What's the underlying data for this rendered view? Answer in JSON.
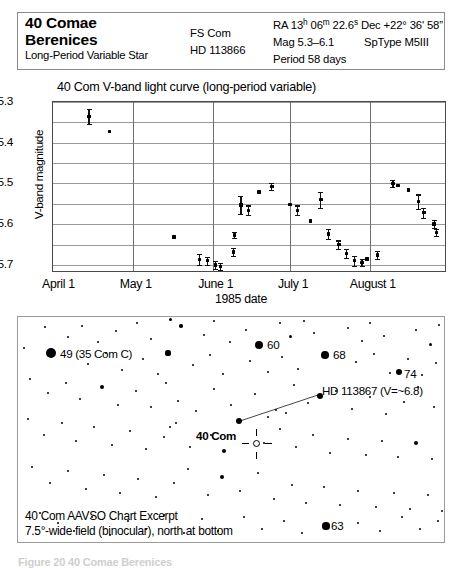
{
  "header": {
    "star_name_line1": "40 Comae",
    "star_name_line2": "Berenices",
    "subtitle": "Long-Period Variable Star",
    "designation_1": "FS Com",
    "designation_2": "HD 113866",
    "ra_label": "RA",
    "ra_hours": "13",
    "ra_h_unit": "h",
    "ra_minutes": "06",
    "ra_m_unit": "m",
    "ra_seconds": "22.6",
    "ra_s_unit": "s",
    "dec": "Dec +22° 36' 58”",
    "mag": "Mag   5.3–6.1",
    "sptype": "SpType M5III",
    "period": "Period 58 days"
  },
  "chart_data": {
    "type": "scatter",
    "title": "40 Com  V-band light curve (long-period variable)",
    "xlabel": "1985 date",
    "ylabel": "V-band magnitude",
    "ylim": [
      5.3,
      5.72
    ],
    "y_inverted": true,
    "yticks": [
      5.3,
      5.4,
      5.5,
      5.6,
      5.7
    ],
    "ygrid_minor": [
      5.35,
      5.45,
      5.55,
      5.65
    ],
    "xlim_days": [
      0,
      153
    ],
    "xtick_labels": [
      "April 1",
      "May 1",
      "June 1",
      "July 1",
      "August 1"
    ],
    "xtick_days": [
      1,
      31,
      62,
      92,
      123
    ],
    "grid": true,
    "legend": "none",
    "points": [
      {
        "day": 14,
        "mag": 5.335,
        "err": 0.018
      },
      {
        "day": 22,
        "mag": 5.372,
        "err": 0.0
      },
      {
        "day": 47,
        "mag": 5.632,
        "err": 0.0
      },
      {
        "day": 57,
        "mag": 5.687,
        "err": 0.014
      },
      {
        "day": 60,
        "mag": 5.69,
        "err": 0.01
      },
      {
        "day": 63,
        "mag": 5.7,
        "err": 0.01
      },
      {
        "day": 65,
        "mag": 5.704,
        "err": 0.008
      },
      {
        "day": 70,
        "mag": 5.668,
        "err": 0.01
      },
      {
        "day": 70.5,
        "mag": 5.627,
        "err": 0.008
      },
      {
        "day": 73,
        "mag": 5.553,
        "err": 0.022
      },
      {
        "day": 76,
        "mag": 5.566,
        "err": 0.012
      },
      {
        "day": 80,
        "mag": 5.521,
        "err": 0.0
      },
      {
        "day": 85,
        "mag": 5.507,
        "err": 0.008
      },
      {
        "day": 92,
        "mag": 5.552,
        "err": 0.0
      },
      {
        "day": 95,
        "mag": 5.566,
        "err": 0.012
      },
      {
        "day": 100,
        "mag": 5.592,
        "err": 0.0
      },
      {
        "day": 104,
        "mag": 5.54,
        "err": 0.02
      },
      {
        "day": 107,
        "mag": 5.624,
        "err": 0.012
      },
      {
        "day": 111,
        "mag": 5.65,
        "err": 0.01
      },
      {
        "day": 114,
        "mag": 5.672,
        "err": 0.012
      },
      {
        "day": 117,
        "mag": 5.69,
        "err": 0.012
      },
      {
        "day": 120,
        "mag": 5.694,
        "err": 0.008
      },
      {
        "day": 122,
        "mag": 5.686,
        "err": 0.0
      },
      {
        "day": 126,
        "mag": 5.676,
        "err": 0.01
      },
      {
        "day": 132,
        "mag": 5.5,
        "err": 0.008
      },
      {
        "day": 134,
        "mag": 5.505,
        "err": 0.0
      },
      {
        "day": 138,
        "mag": 5.516,
        "err": 0.0
      },
      {
        "day": 142,
        "mag": 5.545,
        "err": 0.018
      },
      {
        "day": 144,
        "mag": 5.572,
        "err": 0.012
      },
      {
        "day": 148,
        "mag": 5.6,
        "err": 0.01
      },
      {
        "day": 149,
        "mag": 5.62,
        "err": 0.008
      }
    ]
  },
  "starchart": {
    "caption_line1": "40 Com AAVSO Chart Excerpt",
    "caption_line2": "7.5°-wide field (binocular), north at bottom",
    "labels": [
      {
        "text": "49 (35 Com C)",
        "x": 42,
        "y": 30,
        "bold": false
      },
      {
        "text": "60",
        "x": 249,
        "y": 21,
        "bold": false
      },
      {
        "text": "68",
        "x": 315,
        "y": 31,
        "bold": false
      },
      {
        "text": "74",
        "x": 386,
        "y": 50,
        "bold": false
      },
      {
        "text": "HD 113867 (V=~6.8)",
        "x": 304,
        "y": 67,
        "bold": false
      },
      {
        "text": "40 Com",
        "x": 178,
        "y": 112,
        "bold": true
      },
      {
        "text": "63",
        "x": 313,
        "y": 202,
        "bold": false
      }
    ],
    "named_stars": [
      {
        "x": 33,
        "y": 36,
        "r": 5.2
      },
      {
        "x": 241,
        "y": 28,
        "r": 4.2
      },
      {
        "x": 307,
        "y": 38,
        "r": 3.8
      },
      {
        "x": 381,
        "y": 55,
        "r": 3.2
      },
      {
        "x": 302,
        "y": 79,
        "r": 3.4
      },
      {
        "x": 221,
        "y": 104,
        "r": 3.4
      },
      {
        "x": 308,
        "y": 209,
        "r": 3.6
      }
    ],
    "field_stars": [
      {
        "x": 27,
        "y": 10,
        "r": 1.0
      },
      {
        "x": 50,
        "y": 20,
        "r": 1.3
      },
      {
        "x": 64,
        "y": 9,
        "r": 1.4
      },
      {
        "x": 80,
        "y": 25,
        "r": 1.0
      },
      {
        "x": 98,
        "y": 14,
        "r": 1.1
      },
      {
        "x": 119,
        "y": 6,
        "r": 1.2
      },
      {
        "x": 133,
        "y": 22,
        "r": 1.0
      },
      {
        "x": 152,
        "y": 2,
        "r": 1.5
      },
      {
        "x": 163,
        "y": 9,
        "r": 1.8
      },
      {
        "x": 186,
        "y": 18,
        "r": 1.2
      },
      {
        "x": 196,
        "y": 4,
        "r": 1.1
      },
      {
        "x": 212,
        "y": 25,
        "r": 1.4
      },
      {
        "x": 228,
        "y": 13,
        "r": 1.0
      },
      {
        "x": 262,
        "y": 6,
        "r": 1.0
      },
      {
        "x": 272,
        "y": 19,
        "r": 1.5
      },
      {
        "x": 286,
        "y": 4,
        "r": 1.2
      },
      {
        "x": 296,
        "y": 16,
        "r": 1.0
      },
      {
        "x": 330,
        "y": 11,
        "r": 1.1
      },
      {
        "x": 344,
        "y": 24,
        "r": 1.2
      },
      {
        "x": 352,
        "y": 6,
        "r": 1.0
      },
      {
        "x": 366,
        "y": 19,
        "r": 1.3
      },
      {
        "x": 398,
        "y": 13,
        "r": 1.1
      },
      {
        "x": 412,
        "y": 27,
        "r": 1.5
      },
      {
        "x": 421,
        "y": 8,
        "r": 1.0
      },
      {
        "x": 6,
        "y": 31,
        "r": 1.2
      },
      {
        "x": 70,
        "y": 47,
        "r": 1.4
      },
      {
        "x": 88,
        "y": 36,
        "r": 1.1
      },
      {
        "x": 104,
        "y": 53,
        "r": 1.0
      },
      {
        "x": 125,
        "y": 42,
        "r": 1.3
      },
      {
        "x": 140,
        "y": 57,
        "r": 1.2
      },
      {
        "x": 150,
        "y": 36,
        "r": 2.6
      },
      {
        "x": 175,
        "y": 48,
        "r": 1.1
      },
      {
        "x": 192,
        "y": 38,
        "r": 1.4
      },
      {
        "x": 205,
        "y": 57,
        "r": 1.0
      },
      {
        "x": 232,
        "y": 44,
        "r": 1.2
      },
      {
        "x": 250,
        "y": 55,
        "r": 1.3
      },
      {
        "x": 264,
        "y": 40,
        "r": 1.0
      },
      {
        "x": 280,
        "y": 52,
        "r": 1.1
      },
      {
        "x": 338,
        "y": 45,
        "r": 1.2
      },
      {
        "x": 356,
        "y": 37,
        "r": 1.0
      },
      {
        "x": 372,
        "y": 56,
        "r": 1.3
      },
      {
        "x": 390,
        "y": 42,
        "r": 1.1
      },
      {
        "x": 404,
        "y": 58,
        "r": 1.2
      },
      {
        "x": 418,
        "y": 46,
        "r": 1.0
      },
      {
        "x": 12,
        "y": 62,
        "r": 1.1
      },
      {
        "x": 30,
        "y": 76,
        "r": 1.3
      },
      {
        "x": 48,
        "y": 66,
        "r": 1.0
      },
      {
        "x": 62,
        "y": 82,
        "r": 1.2
      },
      {
        "x": 84,
        "y": 70,
        "r": 2.4
      },
      {
        "x": 100,
        "y": 88,
        "r": 1.1
      },
      {
        "x": 118,
        "y": 74,
        "r": 1.0
      },
      {
        "x": 133,
        "y": 90,
        "r": 1.4
      },
      {
        "x": 148,
        "y": 66,
        "r": 1.2
      },
      {
        "x": 160,
        "y": 84,
        "r": 1.0
      },
      {
        "x": 178,
        "y": 94,
        "r": 1.1
      },
      {
        "x": 196,
        "y": 72,
        "r": 1.3
      },
      {
        "x": 213,
        "y": 88,
        "r": 1.0
      },
      {
        "x": 237,
        "y": 77,
        "r": 1.2
      },
      {
        "x": 258,
        "y": 93,
        "r": 1.1
      },
      {
        "x": 276,
        "y": 68,
        "r": 1.0
      },
      {
        "x": 290,
        "y": 86,
        "r": 1.3
      },
      {
        "x": 318,
        "y": 74,
        "r": 1.2
      },
      {
        "x": 334,
        "y": 92,
        "r": 1.0
      },
      {
        "x": 352,
        "y": 80,
        "r": 1.1
      },
      {
        "x": 368,
        "y": 97,
        "r": 1.2
      },
      {
        "x": 386,
        "y": 85,
        "r": 1.0
      },
      {
        "x": 400,
        "y": 70,
        "r": 1.3
      },
      {
        "x": 416,
        "y": 90,
        "r": 1.4
      },
      {
        "x": 10,
        "y": 102,
        "r": 1.2
      },
      {
        "x": 26,
        "y": 118,
        "r": 1.0
      },
      {
        "x": 44,
        "y": 106,
        "r": 1.1
      },
      {
        "x": 58,
        "y": 124,
        "r": 1.3
      },
      {
        "x": 76,
        "y": 110,
        "r": 1.0
      },
      {
        "x": 94,
        "y": 128,
        "r": 1.2
      },
      {
        "x": 112,
        "y": 114,
        "r": 1.1
      },
      {
        "x": 128,
        "y": 132,
        "r": 1.0
      },
      {
        "x": 146,
        "y": 120,
        "r": 1.3
      },
      {
        "x": 158,
        "y": 106,
        "r": 1.1
      },
      {
        "x": 172,
        "y": 130,
        "r": 1.0
      },
      {
        "x": 193,
        "y": 118,
        "r": 1.2
      },
      {
        "x": 206,
        "y": 134,
        "r": 2.2
      },
      {
        "x": 246,
        "y": 126,
        "r": 1.0
      },
      {
        "x": 262,
        "y": 112,
        "r": 1.1
      },
      {
        "x": 278,
        "y": 130,
        "r": 1.2
      },
      {
        "x": 295,
        "y": 118,
        "r": 1.0
      },
      {
        "x": 312,
        "y": 136,
        "r": 1.3
      },
      {
        "x": 330,
        "y": 122,
        "r": 1.1
      },
      {
        "x": 348,
        "y": 138,
        "r": 1.0
      },
      {
        "x": 364,
        "y": 124,
        "r": 1.2
      },
      {
        "x": 380,
        "y": 140,
        "r": 1.1
      },
      {
        "x": 398,
        "y": 126,
        "r": 2.0
      },
      {
        "x": 414,
        "y": 142,
        "r": 1.0
      },
      {
        "x": 428,
        "y": 112,
        "r": 1.6
      },
      {
        "x": 14,
        "y": 150,
        "r": 1.1
      },
      {
        "x": 32,
        "y": 166,
        "r": 1.0
      },
      {
        "x": 50,
        "y": 154,
        "r": 1.2
      },
      {
        "x": 68,
        "y": 172,
        "r": 1.1
      },
      {
        "x": 86,
        "y": 158,
        "r": 1.0
      },
      {
        "x": 102,
        "y": 176,
        "r": 1.3
      },
      {
        "x": 120,
        "y": 162,
        "r": 1.1
      },
      {
        "x": 138,
        "y": 180,
        "r": 1.0
      },
      {
        "x": 156,
        "y": 166,
        "r": 1.2
      },
      {
        "x": 170,
        "y": 152,
        "r": 1.0
      },
      {
        "x": 190,
        "y": 178,
        "r": 1.1
      },
      {
        "x": 204,
        "y": 160,
        "r": 2.3
      },
      {
        "x": 222,
        "y": 174,
        "r": 1.0
      },
      {
        "x": 240,
        "y": 156,
        "r": 1.2
      },
      {
        "x": 256,
        "y": 182,
        "r": 1.1
      },
      {
        "x": 274,
        "y": 168,
        "r": 1.0
      },
      {
        "x": 288,
        "y": 186,
        "r": 1.3
      },
      {
        "x": 306,
        "y": 170,
        "r": 1.1
      },
      {
        "x": 322,
        "y": 188,
        "r": 1.0
      },
      {
        "x": 340,
        "y": 174,
        "r": 1.2
      },
      {
        "x": 358,
        "y": 190,
        "r": 1.1
      },
      {
        "x": 376,
        "y": 176,
        "r": 1.0
      },
      {
        "x": 392,
        "y": 192,
        "r": 1.2
      },
      {
        "x": 410,
        "y": 178,
        "r": 1.1
      },
      {
        "x": 424,
        "y": 194,
        "r": 1.0
      },
      {
        "x": 22,
        "y": 196,
        "r": 1.1
      },
      {
        "x": 40,
        "y": 206,
        "r": 1.3
      },
      {
        "x": 56,
        "y": 214,
        "r": 1.0
      },
      {
        "x": 74,
        "y": 200,
        "r": 1.1
      },
      {
        "x": 92,
        "y": 218,
        "r": 1.2
      },
      {
        "x": 110,
        "y": 204,
        "r": 1.0
      },
      {
        "x": 128,
        "y": 212,
        "r": 1.1
      },
      {
        "x": 146,
        "y": 198,
        "r": 1.2
      },
      {
        "x": 166,
        "y": 216,
        "r": 1.0
      },
      {
        "x": 184,
        "y": 202,
        "r": 1.1
      },
      {
        "x": 200,
        "y": 214,
        "r": 1.3
      },
      {
        "x": 226,
        "y": 200,
        "r": 1.0
      },
      {
        "x": 244,
        "y": 212,
        "r": 1.1
      },
      {
        "x": 266,
        "y": 204,
        "r": 1.2
      },
      {
        "x": 284,
        "y": 216,
        "r": 1.0
      },
      {
        "x": 340,
        "y": 206,
        "r": 1.1
      },
      {
        "x": 362,
        "y": 214,
        "r": 1.0
      },
      {
        "x": 384,
        "y": 200,
        "r": 1.2
      },
      {
        "x": 402,
        "y": 212,
        "r": 1.1
      },
      {
        "x": 420,
        "y": 204,
        "r": 1.0
      },
      {
        "x": 250,
        "y": 100,
        "r": 1.2
      },
      {
        "x": 268,
        "y": 96,
        "r": 1.0
      },
      {
        "x": 152,
        "y": 110,
        "r": 1.1
      }
    ],
    "leader_line": {
      "x1": 222,
      "y1": 104,
      "x2": 300,
      "y2": 78
    }
  },
  "figure_caption": "Figure 20  40 Comae Berenices"
}
